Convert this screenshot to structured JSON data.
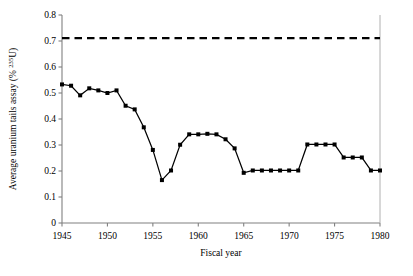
{
  "chart_data": {
    "type": "line",
    "title": "",
    "xlabel": "Fiscal year",
    "ylabel": "Average uranium tails assay (% 235U)",
    "ylabel_prefix": "Average uranium tails assay (% ",
    "ylabel_superscript": "235",
    "ylabel_suffix": "U)",
    "xlim": [
      1945,
      1980
    ],
    "ylim": [
      0,
      0.8
    ],
    "grid": false,
    "legend": "none",
    "xticks": [
      1945,
      1950,
      1955,
      1960,
      1965,
      1970,
      1975,
      1980
    ],
    "xtick_labels": [
      "1945",
      "1950",
      "1955",
      "1960",
      "1965",
      "1970",
      "1975",
      "1980"
    ],
    "yticks": [
      0,
      0.1,
      0.2,
      0.3,
      0.4,
      0.5,
      0.6,
      0.7,
      0.8
    ],
    "ytick_labels": [
      "0",
      "0.1",
      "0.2",
      "0.3",
      "0.4",
      "0.5",
      "0.6",
      "0.7",
      "0.8"
    ],
    "series": [
      {
        "name": "Average uranium tails assay",
        "style": "solid-line-with-square-markers",
        "color": "#000000",
        "x": [
          1945,
          1946,
          1947,
          1948,
          1949,
          1950,
          1951,
          1952,
          1953,
          1954,
          1955,
          1956,
          1957,
          1958,
          1959,
          1960,
          1961,
          1962,
          1963,
          1964,
          1965,
          1966,
          1967,
          1968,
          1969,
          1970,
          1971,
          1972,
          1973,
          1974,
          1975,
          1976,
          1977,
          1978,
          1979,
          1980
        ],
        "values": [
          0.533,
          0.528,
          0.491,
          0.518,
          0.51,
          0.5,
          0.51,
          0.451,
          0.437,
          0.368,
          0.281,
          0.165,
          0.202,
          0.301,
          0.341,
          0.341,
          0.343,
          0.341,
          0.322,
          0.287,
          0.193,
          0.202,
          0.202,
          0.202,
          0.202,
          0.202,
          0.202,
          0.302,
          0.302,
          0.302,
          0.302,
          0.252,
          0.252,
          0.252,
          0.202,
          0.202
        ]
      },
      {
        "name": "Natural uranium assay",
        "style": "dashed-line",
        "color": "#000000",
        "x": [
          1945,
          1980
        ],
        "values": [
          0.711,
          0.711
        ]
      }
    ]
  }
}
